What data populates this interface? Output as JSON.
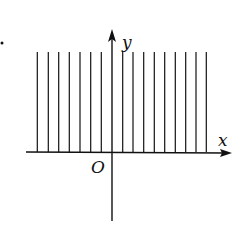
{
  "diagram": {
    "axes": {
      "x_label": "x",
      "y_label": "y",
      "origin_label": "O"
    },
    "colors": {
      "line": "#111111",
      "background": "#ffffff"
    },
    "hatch": {
      "line_count_left_of_axis": 7,
      "line_count_right_of_axis": 9,
      "x_positions": [
        37.3,
        48.3,
        58.7,
        69.3,
        80,
        90.7,
        101.3,
        122.7,
        133,
        143.7,
        154.3,
        164.7,
        175.3,
        185.7,
        196,
        206.3
      ],
      "top_y": 52,
      "bottom_y": 152
    },
    "marker_dot": {
      "x": 2,
      "y": 43
    }
  }
}
